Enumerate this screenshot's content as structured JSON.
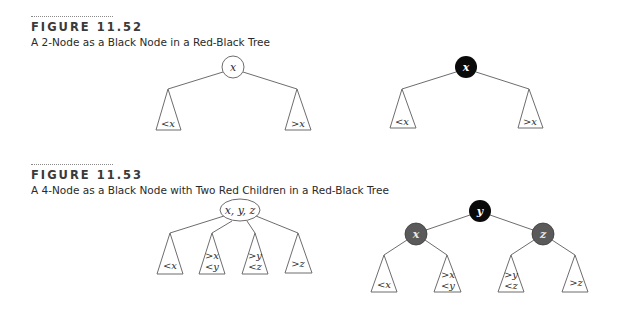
{
  "colors": {
    "black_node": "#0a0a0a",
    "red_node": "#5a5a5a",
    "white_node": "#ffffff",
    "black_node_text": "#ffffff",
    "red_node_text": "#e8e8e8",
    "white_node_text": "#2a2a2a"
  },
  "figures": [
    {
      "label": "FIGURE 11.52",
      "caption": "A 2-Node as a Black Node in a Red-Black Tree",
      "left_diagram": {
        "kind": "2-node",
        "root": {
          "text": "x",
          "color": "white"
        },
        "subtrees": [
          {
            "lines": [
              "<x"
            ]
          },
          {
            "lines": [
              ">x"
            ]
          }
        ]
      },
      "right_diagram": {
        "kind": "red-black",
        "root": {
          "text": "x",
          "color": "black"
        },
        "subtrees": [
          {
            "lines": [
              "<x"
            ]
          },
          {
            "lines": [
              ">x"
            ]
          }
        ]
      }
    },
    {
      "label": "FIGURE 11.53",
      "caption": "A 4-Node as a Black Node with Two Red Children in a Red-Black Tree",
      "left_diagram": {
        "kind": "4-node",
        "root": {
          "text": "x, y, z",
          "color": "white"
        },
        "subtrees": [
          {
            "lines": [
              "<x"
            ]
          },
          {
            "lines": [
              ">x",
              "<y"
            ]
          },
          {
            "lines": [
              ">y",
              "<z"
            ]
          },
          {
            "lines": [
              ">z"
            ]
          }
        ]
      },
      "right_diagram": {
        "kind": "red-black",
        "root": {
          "text": "y",
          "color": "black"
        },
        "children": [
          {
            "text": "x",
            "color": "red"
          },
          {
            "text": "z",
            "color": "red"
          }
        ],
        "subtrees": [
          {
            "lines": [
              "<x"
            ]
          },
          {
            "lines": [
              ">x",
              "<y"
            ]
          },
          {
            "lines": [
              ">y",
              "<z"
            ]
          },
          {
            "lines": [
              ">z"
            ]
          }
        ]
      }
    }
  ]
}
